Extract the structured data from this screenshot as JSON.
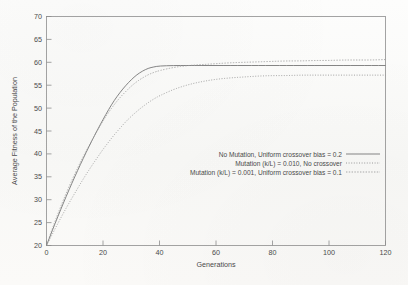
{
  "chart_data": {
    "type": "line",
    "title": "",
    "xlabel": "Generations",
    "ylabel": "Average Fitness of the Population",
    "xlim": [
      0,
      120
    ],
    "ylim": [
      20,
      70
    ],
    "xticks": [
      0,
      20,
      40,
      60,
      80,
      100,
      120
    ],
    "yticks": [
      20,
      25,
      30,
      35,
      40,
      45,
      50,
      55,
      60,
      65,
      70
    ],
    "xtick_labels": [
      "0",
      "20",
      "40",
      "60",
      "80",
      "100",
      "120"
    ],
    "ytick_labels": [
      "20",
      "25",
      "30",
      "35",
      "40",
      "45",
      "50",
      "55",
      "60",
      "65",
      "70"
    ],
    "grid": false,
    "legend_position": "center-right",
    "x": [
      0,
      2,
      4,
      6,
      8,
      10,
      12,
      14,
      16,
      18,
      20,
      22,
      24,
      26,
      28,
      30,
      32,
      34,
      36,
      38,
      40,
      45,
      50,
      55,
      60,
      65,
      70,
      75,
      80,
      85,
      90,
      95,
      100,
      105,
      110,
      115,
      120
    ],
    "series": [
      {
        "name": "No Mutation, Uniform crossover bias = 0.2",
        "style": "solid",
        "color": "#6f6f6f",
        "values": [
          20.0,
          23.2,
          26.3,
          29.3,
          32.2,
          35.0,
          37.7,
          40.3,
          42.8,
          45.2,
          47.5,
          49.7,
          51.7,
          53.4,
          54.9,
          56.2,
          57.3,
          58.1,
          58.7,
          59.0,
          59.2,
          59.3,
          59.3,
          59.3,
          59.3,
          59.3,
          59.3,
          59.3,
          59.3,
          59.3,
          59.3,
          59.3,
          59.3,
          59.3,
          59.3,
          59.3,
          59.3
        ]
      },
      {
        "name": "Mutation (k/L) = 0.010, No crossover",
        "style": "fine-dotted",
        "color": "#8a8a8a",
        "values": [
          20.0,
          22.4,
          24.8,
          27.1,
          29.3,
          31.4,
          33.5,
          35.5,
          37.4,
          39.2,
          41.0,
          42.6,
          44.2,
          45.6,
          47.0,
          48.2,
          49.3,
          50.3,
          51.2,
          52.0,
          52.7,
          54.1,
          55.1,
          55.8,
          56.3,
          56.6,
          56.8,
          57.0,
          57.1,
          57.1,
          57.2,
          57.2,
          57.2,
          57.2,
          57.2,
          57.2,
          57.2
        ]
      },
      {
        "name": "Mutation (k/L) = 0.001, Uniform crossover bias = 0.1",
        "style": "dotted",
        "color": "#9a9a9a",
        "values": [
          20.0,
          23.6,
          26.9,
          30.0,
          32.9,
          35.6,
          38.2,
          40.6,
          42.9,
          45.1,
          47.2,
          49.1,
          50.8,
          52.3,
          53.6,
          54.8,
          55.8,
          56.6,
          57.3,
          57.8,
          58.2,
          58.9,
          59.3,
          59.5,
          59.7,
          59.9,
          60.0,
          60.1,
          60.2,
          60.3,
          60.3,
          60.4,
          60.4,
          60.5,
          60.5,
          60.5,
          60.6
        ]
      }
    ]
  },
  "legend": {
    "entries": [
      "No Mutation, Uniform crossover bias = 0.2",
      "Mutation (k/L) = 0.010, No crossover",
      "Mutation (k/L) = 0.001, Uniform crossover bias = 0.1"
    ]
  },
  "axes": {
    "x_title": "Generations",
    "y_title": "Average Fitness of the Population"
  }
}
